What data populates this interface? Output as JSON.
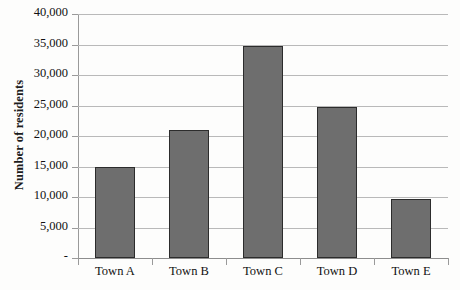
{
  "chart_data": {
    "type": "bar",
    "title": "",
    "xlabel": "",
    "ylabel": "Number of residents",
    "categories": [
      "Town A",
      "Town B",
      "Town C",
      "Town D",
      "Town E"
    ],
    "values": [
      15000,
      21000,
      34700,
      24700,
      9700
    ],
    "ylim": [
      0,
      40000
    ],
    "ytick_values": [
      0,
      5000,
      10000,
      15000,
      20000,
      25000,
      30000,
      35000,
      40000
    ],
    "ytick_labels": [
      "-",
      "5,000",
      "10,000",
      "15,000",
      "20,000",
      "25,000",
      "30,000",
      "35,000",
      "40,000"
    ],
    "grid": true,
    "legend": false,
    "legend_position": "none",
    "bar_color": "#6e6e6e",
    "bar_border_color": "#2c2c2c",
    "gridline_color": "#b9b9b9",
    "axis_color": "#9a9a9a",
    "background_color": "#fdfdfc"
  }
}
